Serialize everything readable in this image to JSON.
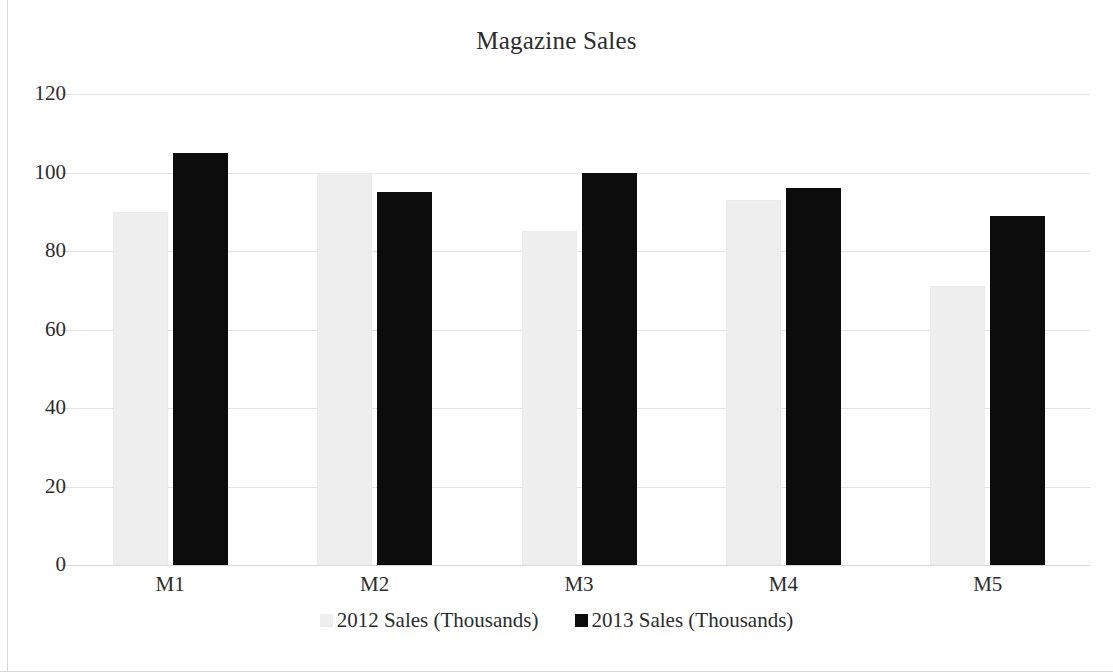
{
  "chart_data": {
    "type": "bar",
    "title": "Magazine Sales",
    "xlabel": "",
    "ylabel": "",
    "categories": [
      "M1",
      "M2",
      "M3",
      "M4",
      "M5"
    ],
    "series": [
      {
        "name": "2012 Sales (Thousands)",
        "color": "#eeeeee",
        "values": [
          90,
          100,
          85,
          93,
          71
        ]
      },
      {
        "name": "2013 Sales (Thousands)",
        "color": "#0c0c0c",
        "values": [
          105,
          95,
          100,
          96,
          89
        ]
      }
    ],
    "ylim": [
      0,
      120
    ],
    "yticks": [
      0,
      20,
      40,
      60,
      80,
      100,
      120
    ],
    "ytick_labels": [
      "0",
      "20",
      "40",
      "60",
      "80",
      "100",
      "120"
    ],
    "grid": "horizontal",
    "legend_position": "bottom"
  },
  "colors": {
    "background": "#ffffff",
    "text": "#2c2c2c",
    "gridline": "#e4e4e4",
    "frame": "#d8d8d8",
    "series_2012": "#eeeeee",
    "series_2013": "#0c0c0c"
  }
}
